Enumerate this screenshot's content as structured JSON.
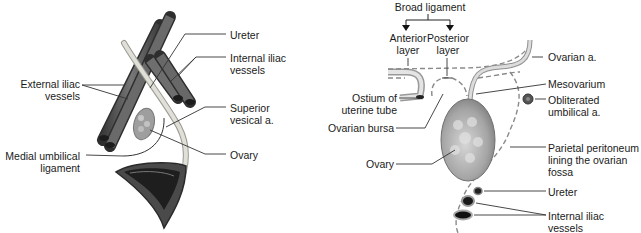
{
  "left_panel": {
    "labels": {
      "ureter": "Ureter",
      "internal_iliac_1": "Internal iliac",
      "internal_iliac_2": "vessels",
      "external_iliac_1": "External iliac",
      "external_iliac_2": "vessels",
      "superior_vesical_1": "Superior",
      "superior_vesical_2": "vesical a.",
      "medial_umbilical_1": "Medial umbilical",
      "medial_umbilical_2": "ligament",
      "ovary": "Ovary"
    }
  },
  "right_panel": {
    "labels": {
      "broad_ligament": "Broad ligament",
      "anterior_1": "Anterior",
      "anterior_2": "layer",
      "posterior_1": "Posterior",
      "posterior_2": "layer",
      "ostium_1": "Ostium of",
      "ostium_2": "uterine tube",
      "ovarian_bursa": "Ovarian bursa",
      "ovary": "Ovary",
      "ovarian_a": "Ovarian a.",
      "mesovarium": "Mesovarium",
      "obliterated_1": "Obliterated",
      "obliterated_2": "umbilical a.",
      "parietal_1": "Parietal peritoneum",
      "parietal_2": "lining the ovarian",
      "parietal_3": "fossa",
      "ureter": "Ureter",
      "internal_iliac_1": "Internal iliac",
      "internal_iliac_2": "vessels"
    }
  },
  "colors": {
    "vessel": "#5a5a5a",
    "vessel_dark": "#2e2e2e",
    "ureter": "#d8d8d0",
    "ovary": "#a8a8a8",
    "leader": "#333333",
    "dashed": "#8a8a8a"
  }
}
